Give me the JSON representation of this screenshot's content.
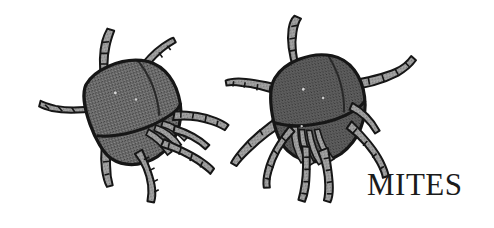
{
  "figure": {
    "kind": "scanned-line-illustration",
    "width": 494,
    "height": 228,
    "background_color": "#ffffff",
    "ink_color": "#151515",
    "body_fill_color": "#6a6a6a",
    "leg_fill_color": "#9a9a9a",
    "caption": {
      "text": "MITES",
      "color": "#1b1b1b",
      "position": "bottom-right"
    },
    "specimens": [
      {
        "name": "left-mite",
        "center_x": 128,
        "center_y": 108,
        "rotation_deg": -18,
        "leg_count": 8
      },
      {
        "name": "right-mite",
        "center_x": 312,
        "center_y": 105,
        "rotation_deg": -12,
        "leg_count": 8
      }
    ]
  }
}
